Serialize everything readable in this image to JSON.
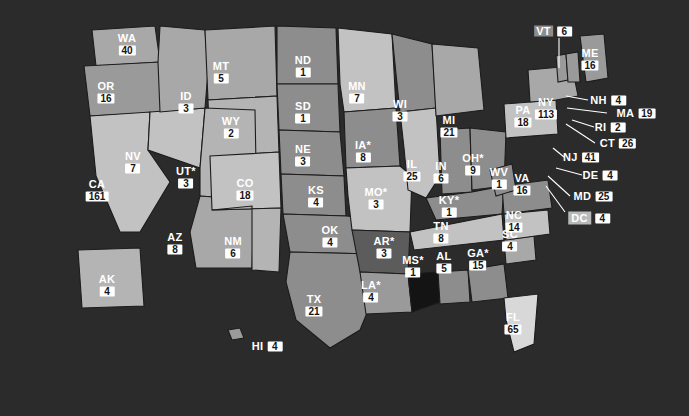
{
  "map": {
    "title": "United States choropleth with per-state values",
    "background_color": "#2b2b2b",
    "label_value_chip_color": "#ffffff",
    "border_color": "#1c1c1c",
    "asterisk_marker": "*",
    "shade_scale": [
      "#141414",
      "#4a4a4a",
      "#6e6e6e",
      "#8d8d8d",
      "#a8a8a8",
      "#c2c2c2",
      "#d8d8d8"
    ],
    "states": [
      {
        "id": "WA",
        "abbr": "WA",
        "value": "40",
        "asterisk": false,
        "x": 127,
        "y": 44,
        "fill": "#a8a8a8",
        "callout": false
      },
      {
        "id": "OR",
        "abbr": "OR",
        "value": "16",
        "asterisk": false,
        "x": 106,
        "y": 92,
        "fill": "#9a9a9a",
        "callout": false
      },
      {
        "id": "CA",
        "abbr": "CA",
        "value": "161",
        "asterisk": false,
        "x": 97,
        "y": 190,
        "fill": "#c2c2c2",
        "callout": false
      },
      {
        "id": "NV",
        "abbr": "NV",
        "value": "7",
        "asterisk": false,
        "x": 133,
        "y": 162,
        "fill": "#c2c2c2",
        "callout": false
      },
      {
        "id": "ID",
        "abbr": "ID",
        "value": "3",
        "asterisk": false,
        "x": 186,
        "y": 102,
        "fill": "#a8a8a8",
        "callout": false
      },
      {
        "id": "MT",
        "abbr": "MT",
        "value": "5",
        "asterisk": false,
        "x": 221,
        "y": 72,
        "fill": "#a8a8a8",
        "callout": false
      },
      {
        "id": "WY",
        "abbr": "WY",
        "value": "2",
        "asterisk": false,
        "x": 231,
        "y": 127,
        "fill": "#b4b4b4",
        "callout": false
      },
      {
        "id": "UT",
        "abbr": "UT",
        "value": "3",
        "asterisk": true,
        "x": 186,
        "y": 177,
        "fill": "#b4b4b4",
        "callout": false
      },
      {
        "id": "AZ",
        "abbr": "AZ",
        "value": "8",
        "asterisk": false,
        "x": 175,
        "y": 243,
        "fill": "#a8a8a8",
        "callout": false
      },
      {
        "id": "CO",
        "abbr": "CO",
        "value": "18",
        "asterisk": false,
        "x": 245,
        "y": 189,
        "fill": "#c2c2c2",
        "callout": false
      },
      {
        "id": "NM",
        "abbr": "NM",
        "value": "6",
        "asterisk": false,
        "x": 233,
        "y": 247,
        "fill": "#b4b4b4",
        "callout": false
      },
      {
        "id": "ND",
        "abbr": "ND",
        "value": "1",
        "asterisk": false,
        "x": 303,
        "y": 66,
        "fill": "#8d8d8d",
        "callout": false
      },
      {
        "id": "SD",
        "abbr": "SD",
        "value": "1",
        "asterisk": false,
        "x": 303,
        "y": 112,
        "fill": "#8d8d8d",
        "callout": false
      },
      {
        "id": "NE",
        "abbr": "NE",
        "value": "3",
        "asterisk": false,
        "x": 303,
        "y": 155,
        "fill": "#8d8d8d",
        "callout": false
      },
      {
        "id": "KS",
        "abbr": "KS",
        "value": "4",
        "asterisk": false,
        "x": 316,
        "y": 196,
        "fill": "#8d8d8d",
        "callout": false
      },
      {
        "id": "OK",
        "abbr": "OK",
        "value": "4",
        "asterisk": false,
        "x": 330,
        "y": 236,
        "fill": "#8d8d8d",
        "callout": false
      },
      {
        "id": "TX",
        "abbr": "TX",
        "value": "21",
        "asterisk": false,
        "x": 314,
        "y": 305,
        "fill": "#8d8d8d",
        "callout": false
      },
      {
        "id": "MN",
        "abbr": "MN",
        "value": "7",
        "asterisk": false,
        "x": 357,
        "y": 92,
        "fill": "#c2c2c2",
        "callout": false
      },
      {
        "id": "IA",
        "abbr": "IA",
        "value": "8",
        "asterisk": true,
        "x": 363,
        "y": 151,
        "fill": "#8d8d8d",
        "callout": false
      },
      {
        "id": "MO",
        "abbr": "MO",
        "value": "3",
        "asterisk": true,
        "x": 376,
        "y": 198,
        "fill": "#c2c2c2",
        "callout": false
      },
      {
        "id": "AR",
        "abbr": "AR",
        "value": "3",
        "asterisk": true,
        "x": 384,
        "y": 247,
        "fill": "#5c5c5c",
        "callout": false
      },
      {
        "id": "LA",
        "abbr": "LA",
        "value": "4",
        "asterisk": true,
        "x": 371,
        "y": 291,
        "fill": "#9a9a9a",
        "callout": false
      },
      {
        "id": "WI",
        "abbr": "WI",
        "value": "3",
        "asterisk": false,
        "x": 400,
        "y": 110,
        "fill": "#8d8d8d",
        "callout": false
      },
      {
        "id": "IL",
        "abbr": "IL",
        "value": "25",
        "asterisk": false,
        "x": 412,
        "y": 170,
        "fill": "#c2c2c2",
        "callout": false
      },
      {
        "id": "MI",
        "abbr": "MI",
        "value": "21",
        "asterisk": false,
        "x": 449,
        "y": 126,
        "fill": "#a8a8a8",
        "callout": false
      },
      {
        "id": "IN",
        "abbr": "IN",
        "value": "6",
        "asterisk": false,
        "x": 441,
        "y": 172,
        "fill": "#8d8d8d",
        "callout": false
      },
      {
        "id": "OH",
        "abbr": "OH",
        "value": "9",
        "asterisk": true,
        "x": 473,
        "y": 164,
        "fill": "#8d8d8d",
        "callout": false
      },
      {
        "id": "KY",
        "abbr": "KY",
        "value": "1",
        "asterisk": true,
        "x": 449,
        "y": 206,
        "fill": "#8d8d8d",
        "callout": false
      },
      {
        "id": "TN",
        "abbr": "TN",
        "value": "8",
        "asterisk": false,
        "x": 441,
        "y": 232,
        "fill": "#c2c2c2",
        "callout": false
      },
      {
        "id": "MS",
        "abbr": "MS",
        "value": "1",
        "asterisk": true,
        "x": 413,
        "y": 266,
        "fill": "#141414",
        "callout": false
      },
      {
        "id": "AL",
        "abbr": "AL",
        "value": "5",
        "asterisk": false,
        "x": 444,
        "y": 262,
        "fill": "#8d8d8d",
        "callout": false
      },
      {
        "id": "GA",
        "abbr": "GA",
        "value": "15",
        "asterisk": true,
        "x": 478,
        "y": 259,
        "fill": "#8d8d8d",
        "callout": false
      },
      {
        "id": "FL",
        "abbr": "FL",
        "value": "65",
        "asterisk": false,
        "x": 513,
        "y": 323,
        "fill": "#d8d8d8",
        "callout": false
      },
      {
        "id": "SC",
        "abbr": "SC",
        "value": "4",
        "asterisk": false,
        "x": 510,
        "y": 240,
        "fill": "#a8a8a8",
        "callout": false
      },
      {
        "id": "NC",
        "abbr": "NC",
        "value": "14",
        "asterisk": false,
        "x": 514,
        "y": 221,
        "fill": "#c2c2c2",
        "callout": false
      },
      {
        "id": "VA",
        "abbr": "VA",
        "value": "16",
        "asterisk": false,
        "x": 522,
        "y": 184,
        "fill": "#8d8d8d",
        "callout": false
      },
      {
        "id": "WV",
        "abbr": "WV",
        "value": "1",
        "asterisk": false,
        "x": 499,
        "y": 178,
        "fill": "#8d8d8d",
        "callout": false
      },
      {
        "id": "PA",
        "abbr": "PA",
        "value": "18",
        "asterisk": false,
        "x": 523,
        "y": 116,
        "fill": "#c2c2c2",
        "callout": false
      },
      {
        "id": "NY",
        "abbr": "NY",
        "value": "113",
        "asterisk": false,
        "x": 546,
        "y": 108,
        "fill": "#a8a8a8",
        "callout": false
      },
      {
        "id": "AK",
        "abbr": "AK",
        "value": "4",
        "asterisk": false,
        "x": 107,
        "y": 285,
        "fill": "#b4b4b4",
        "callout": false
      }
    ],
    "callouts": [
      {
        "id": "VT",
        "abbr": "VT",
        "value": "6",
        "x": 553,
        "y": 31,
        "chip": true,
        "leader": [
          [
            559,
            38
          ],
          [
            559,
            68
          ]
        ]
      },
      {
        "id": "ME",
        "abbr": "ME",
        "value": "16",
        "x": 590,
        "y": 59,
        "chip": false,
        "leader": null,
        "stacked": true
      },
      {
        "id": "NH",
        "abbr": "NH",
        "value": "4",
        "x": 608,
        "y": 100,
        "chip": false,
        "leader": [
          [
            588,
            100
          ],
          [
            566,
            96
          ]
        ]
      },
      {
        "id": "MA",
        "abbr": "MA",
        "value": "19",
        "x": 636,
        "y": 113,
        "chip": false,
        "leader": [
          [
            607,
            113
          ],
          [
            567,
            108
          ]
        ]
      },
      {
        "id": "RI",
        "abbr": "RI",
        "value": "2",
        "x": 610,
        "y": 127,
        "chip": false,
        "leader": [
          [
            594,
            127
          ],
          [
            572,
            120
          ]
        ]
      },
      {
        "id": "CT",
        "abbr": "CT",
        "value": "26",
        "x": 618,
        "y": 143,
        "chip": false,
        "leader": [
          [
            595,
            143
          ],
          [
            566,
            124
          ]
        ]
      },
      {
        "id": "NJ",
        "abbr": "NJ",
        "value": "41",
        "x": 581,
        "y": 157,
        "chip": false,
        "leader": [
          [
            564,
            157
          ],
          [
            553,
            148
          ]
        ]
      },
      {
        "id": "DE",
        "abbr": "DE",
        "value": "4",
        "x": 600,
        "y": 175,
        "chip": false,
        "leader": [
          [
            582,
            175
          ],
          [
            556,
            168
          ]
        ]
      },
      {
        "id": "MD",
        "abbr": "MD",
        "value": "25",
        "x": 593,
        "y": 196,
        "chip": false,
        "leader": [
          [
            570,
            196
          ],
          [
            548,
            176
          ]
        ]
      },
      {
        "id": "DC",
        "abbr": "DC",
        "value": "4",
        "x": 589,
        "y": 218,
        "chip": false,
        "dcchip": true,
        "leader": [
          [
            565,
            212
          ],
          [
            546,
            186
          ]
        ]
      },
      {
        "id": "HI",
        "abbr": "HI",
        "value": "4",
        "x": 267,
        "y": 346,
        "chip": false,
        "leader": null
      }
    ]
  }
}
